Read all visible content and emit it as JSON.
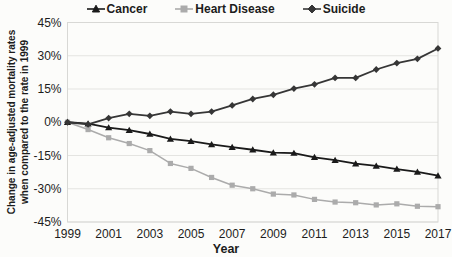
{
  "figure": {
    "xlabel": "Year",
    "ylabel_line1": "Change in age-adjusted mortality rates",
    "ylabel_line2": "when compared to the rate in 1999"
  },
  "colors": {
    "background": "#fcfcfa",
    "grid": "#e4e4e1",
    "plot_border": "#d8d8d5",
    "tick_text": "#1c1c1c",
    "cancer": "#1a1a1a",
    "heart_disease": "#ababab",
    "suicide": "#363636"
  },
  "chart_data": {
    "type": "line",
    "title": "",
    "xlabel": "Year",
    "ylabel": "Change in age-adjusted mortality rates when compared to the rate in 1999",
    "x": [
      1999,
      2000,
      2001,
      2002,
      2003,
      2004,
      2005,
      2006,
      2007,
      2008,
      2009,
      2010,
      2011,
      2012,
      2013,
      2014,
      2015,
      2016,
      2017
    ],
    "x_tick_labels": [
      "1999",
      "2001",
      "2003",
      "2005",
      "2007",
      "2009",
      "2011",
      "2013",
      "2015",
      "2017"
    ],
    "y_tick_labels": [
      "45%",
      "30%",
      "15%",
      "0%",
      "-15%",
      "-30%",
      "-45%"
    ],
    "y_tick_values": [
      45,
      30,
      15,
      0,
      -15,
      -30,
      -45
    ],
    "ylim": [
      -45,
      45
    ],
    "grid": "horizontal",
    "legend_position": "top",
    "series": [
      {
        "name": "Cancer",
        "marker": "triangle",
        "color": "#1a1a1a",
        "values": [
          0,
          -0.6,
          -2.4,
          -3.6,
          -5.3,
          -7.5,
          -8.5,
          -10.0,
          -11.2,
          -12.4,
          -13.7,
          -13.9,
          -15.8,
          -17.1,
          -18.7,
          -19.7,
          -21.1,
          -22.4,
          -24.1
        ]
      },
      {
        "name": "Heart Disease",
        "marker": "square",
        "color": "#ababab",
        "values": [
          0,
          -3.3,
          -7.0,
          -9.6,
          -12.8,
          -18.6,
          -20.8,
          -24.9,
          -28.4,
          -30.0,
          -32.4,
          -32.8,
          -34.8,
          -36.0,
          -36.3,
          -37.3,
          -36.8,
          -37.9,
          -38.1
        ]
      },
      {
        "name": "Suicide",
        "marker": "diamond",
        "color": "#363636",
        "values": [
          0,
          -1.0,
          1.9,
          3.8,
          2.9,
          4.8,
          3.8,
          4.8,
          7.6,
          10.5,
          12.4,
          15.2,
          17.1,
          20.0,
          20.0,
          23.8,
          26.7,
          28.6,
          33.3
        ]
      }
    ]
  }
}
